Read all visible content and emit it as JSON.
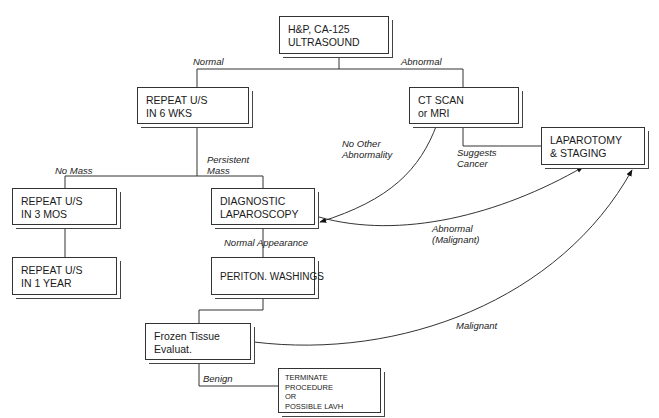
{
  "nodes": {
    "hp": {
      "lines": [
        "H&P, CA-125",
        "ULTRASOUND"
      ]
    },
    "repeat6": {
      "lines": [
        "REPEAT U/S",
        "IN 6 WKS"
      ]
    },
    "ct": {
      "lines": [
        "CT SCAN",
        "or MRI"
      ]
    },
    "lap_staging": {
      "lines": [
        "LAPAROTOMY",
        "& STAGING"
      ]
    },
    "repeat3": {
      "lines": [
        "REPEAT U/S",
        "IN 3 MOS"
      ]
    },
    "diag_lap": {
      "lines": [
        "DIAGNOSTIC",
        "LAPAROSCOPY"
      ]
    },
    "repeat1y": {
      "lines": [
        "REPEAT U/S",
        "IN 1 YEAR"
      ]
    },
    "periton": {
      "lines": [
        "PERITON. WASHINGS"
      ]
    },
    "frozen": {
      "lines": [
        "Frozen Tissue",
        "Evaluat."
      ]
    },
    "terminate": {
      "lines": [
        "TERMINATE",
        "PROCEDURE",
        "OR",
        "POSSIBLE LAVH"
      ]
    }
  },
  "edge_labels": {
    "normal": {
      "lines": [
        "Normal"
      ]
    },
    "abnormal": {
      "lines": [
        "Abnormal"
      ]
    },
    "no_other": {
      "lines": [
        "No Other",
        "Abnormality"
      ]
    },
    "suggests": {
      "lines": [
        "Suggests",
        "Cancer"
      ]
    },
    "no_mass": {
      "lines": [
        "No Mass"
      ]
    },
    "persistent": {
      "lines": [
        "Persistent",
        "Mass"
      ]
    },
    "abn_malig": {
      "lines": [
        "Abnormal",
        "(Malignant)"
      ]
    },
    "normal_app": {
      "lines": [
        "Normal Appearance"
      ]
    },
    "malignant": {
      "lines": [
        "Malignant"
      ]
    },
    "benign": {
      "lines": [
        "Benign"
      ]
    }
  }
}
